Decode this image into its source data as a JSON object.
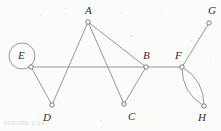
{
  "figure": {
    "kind": "undirected-graph-diagram",
    "caption": "FIGURE 2.14",
    "background_color": "#fbfbfa",
    "edge_color": "#8b8b8b",
    "vertex_stroke_color": "#6e6e6e",
    "vertex_fill_color": "#ffffff",
    "label_color": "#2c2c2c",
    "width": 221,
    "height": 131
  },
  "graph_data": {
    "type": "graph",
    "directed": false,
    "vertices": [
      {
        "id": "A",
        "label": "A",
        "x": 88,
        "y": 22,
        "label_x": 85,
        "label_y": 5
      },
      {
        "id": "B",
        "label": "B",
        "x": 146,
        "y": 67,
        "label_x": 143,
        "label_y": 50
      },
      {
        "id": "C",
        "label": "C",
        "x": 124,
        "y": 104,
        "label_x": 128,
        "label_y": 111
      },
      {
        "id": "D",
        "label": "D",
        "x": 52,
        "y": 105,
        "label_x": 43,
        "label_y": 112
      },
      {
        "id": "E",
        "label": "E",
        "x": 31,
        "y": 67,
        "label_x": 18,
        "label_y": 50
      },
      {
        "id": "F",
        "label": "F",
        "x": 182,
        "y": 67,
        "label_x": 175,
        "label_y": 50
      },
      {
        "id": "G",
        "label": "G",
        "x": 209,
        "y": 23,
        "label_x": 208,
        "label_y": 5
      },
      {
        "id": "H",
        "label": "H",
        "x": 204,
        "y": 106,
        "label_x": 198,
        "label_y": 112
      }
    ],
    "edges": [
      {
        "from": "A",
        "to": "D",
        "style": "straight"
      },
      {
        "from": "A",
        "to": "C",
        "style": "straight"
      },
      {
        "from": "A",
        "to": "B",
        "style": "straight"
      },
      {
        "from": "E",
        "to": "D",
        "style": "straight"
      },
      {
        "from": "E",
        "to": "B",
        "style": "straight"
      },
      {
        "from": "B",
        "to": "C",
        "style": "straight"
      },
      {
        "from": "B",
        "to": "F",
        "style": "straight"
      },
      {
        "from": "F",
        "to": "G",
        "style": "straight"
      },
      {
        "from": "F",
        "to": "H",
        "style": "curve-left"
      },
      {
        "from": "F",
        "to": "H",
        "style": "curve-right"
      }
    ],
    "self_loops": [
      {
        "at": "E",
        "cx": 22,
        "cy": 56,
        "r": 13
      }
    ],
    "degrees": {
      "A": 3,
      "B": 4,
      "C": 2,
      "D": 2,
      "E": 4,
      "F": 4,
      "G": 1,
      "H": 2
    }
  }
}
